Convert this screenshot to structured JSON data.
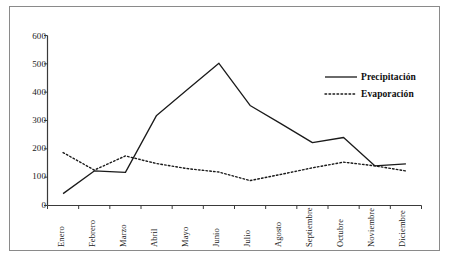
{
  "chart_data": {
    "type": "line",
    "title": "",
    "subtitle": "",
    "xlabel": "",
    "ylabel": "",
    "categories": [
      "Enero",
      "Febrero",
      "Marzo",
      "Abril",
      "Mayo",
      "Junio",
      "Julio",
      "Agosto",
      "Septiembre",
      "Octubre",
      "Noviembre",
      "Diciembre"
    ],
    "ylim": [
      0,
      600
    ],
    "yticks": [
      0,
      100,
      200,
      300,
      400,
      500,
      600
    ],
    "ytick_labels": [
      "0",
      "100",
      "200",
      "300",
      "400",
      "500",
      "600"
    ],
    "grid": false,
    "legend_position": "upper-right",
    "series": [
      {
        "name": "Precipitación",
        "style": "solid",
        "color": "#1a1a1a",
        "values": [
          42,
          122,
          117,
          318,
          410,
          502,
          353,
          288,
          222,
          240,
          140,
          147
        ]
      },
      {
        "name": "Evaporación",
        "style": "dotted",
        "color": "#1a1a1a",
        "values": [
          187,
          125,
          175,
          148,
          130,
          118,
          88,
          110,
          133,
          153,
          140,
          122
        ]
      }
    ]
  },
  "axes": {
    "y_axis_name": "y-axis",
    "x_axis_name": "x-axis"
  }
}
